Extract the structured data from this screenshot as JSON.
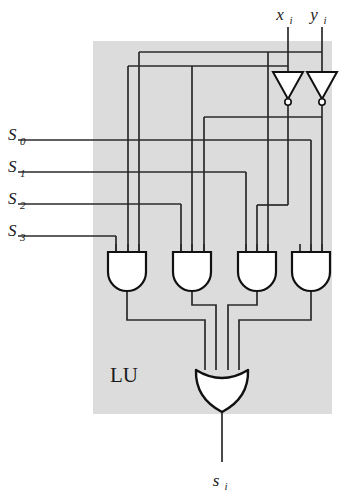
{
  "figure": {
    "block_label": "LU",
    "background_color": "#ffffff",
    "block_fill": "#dcdcdc",
    "wire_color": "#2a2a2a",
    "gate_fill": "#ffffff",
    "gate_stroke": "#111111"
  },
  "inputs": {
    "data": [
      {
        "name": "x",
        "subscript": "i"
      },
      {
        "name": "y",
        "subscript": "i"
      }
    ],
    "selects": [
      {
        "name": "S",
        "subscript": "0"
      },
      {
        "name": "S",
        "subscript": "1"
      },
      {
        "name": "S",
        "subscript": "2"
      },
      {
        "name": "S",
        "subscript": "3"
      }
    ]
  },
  "output": {
    "name": "s",
    "subscript": "i"
  },
  "gates": {
    "inverters": [
      {
        "id": "inv-x",
        "input": "x_i",
        "output": "not_x_i"
      },
      {
        "id": "inv-y",
        "input": "y_i",
        "output": "not_y_i"
      }
    ],
    "and_gates": [
      {
        "id": "and-1",
        "inputs": [
          "S3",
          "not_x_i",
          "not_y_i"
        ]
      },
      {
        "id": "and-2",
        "inputs": [
          "S2",
          "not_x_i",
          "y_i"
        ]
      },
      {
        "id": "and-3",
        "inputs": [
          "S1",
          "x_i",
          "not_y_i"
        ]
      },
      {
        "id": "and-4",
        "inputs": [
          "S0",
          "x_i",
          "y_i"
        ]
      }
    ],
    "or_gate": {
      "id": "or-1",
      "inputs": 4,
      "output": "s_i"
    }
  }
}
